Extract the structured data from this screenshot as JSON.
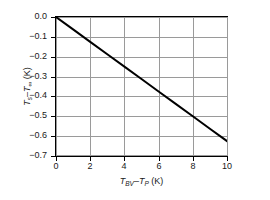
{
  "chart_data": {
    "type": "line",
    "title": "",
    "xlabel": "T_BV − T_P (K)",
    "ylabel": "T_s − T_inf (K)",
    "xlabel_parts": {
      "sym1": "T",
      "sub1": "BV",
      "dash": "–",
      "sym2": "T",
      "sub2": "P",
      "unit": "(K)"
    },
    "ylabel_parts": {
      "sym1": "T",
      "sub1": "s",
      "dash": "–",
      "sym2": "T",
      "sub2": "∞",
      "unit": "(K)"
    },
    "xlim": [
      0,
      10
    ],
    "ylim": [
      -0.7,
      0.0
    ],
    "xticks": [
      0,
      2,
      4,
      6,
      8,
      10
    ],
    "yticks": [
      0.0,
      -0.1,
      -0.2,
      -0.3,
      -0.4,
      -0.5,
      -0.6,
      -0.7
    ],
    "xticklabels": [
      "0",
      "2",
      "4",
      "6",
      "8",
      "10"
    ],
    "yticklabels": [
      "0.0",
      "−0.1",
      "−0.2",
      "−0.3",
      "−0.4",
      "−0.5",
      "−0.6",
      "−0.7"
    ],
    "grid": true,
    "grid_color": "#9a9a9a",
    "frame_color": "#000000",
    "legend": null,
    "series": [
      {
        "name": "Ts-Tinf vs TBV-TP",
        "color": "#000000",
        "linewidth": 2,
        "x": [
          0,
          1,
          2,
          3,
          4,
          5,
          6,
          7,
          8,
          9,
          10
        ],
        "y": [
          0.0,
          -0.0625,
          -0.125,
          -0.1875,
          -0.25,
          -0.3125,
          -0.375,
          -0.4375,
          -0.5,
          -0.5625,
          -0.625
        ]
      }
    ]
  }
}
